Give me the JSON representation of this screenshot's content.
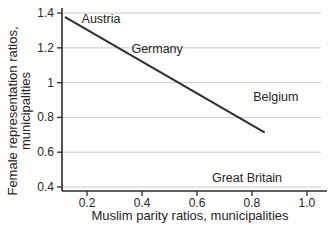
{
  "chart_data": {
    "type": "line",
    "title": "",
    "xlabel": "Muslim parity ratios, municipalities",
    "ylabel": "Female representation ratios, municipalities",
    "ylabel_lines": [
      "Female representation ratios,",
      "municipalities"
    ],
    "xlim": [
      0.109,
      1.073
    ],
    "ylim": [
      0.377,
      1.429
    ],
    "x_ticks": [
      0.2,
      0.4,
      0.6,
      0.8,
      1.0
    ],
    "x_tick_labels": [
      "0.2",
      "0.4",
      "0.6",
      "0.8",
      "1.0"
    ],
    "y_ticks": [
      0.4,
      0.6,
      0.8,
      1.0,
      1.2,
      1.4
    ],
    "y_tick_labels": [
      "0.4",
      "0.6",
      "0.8",
      "1",
      "1.2",
      "1.4"
    ],
    "grid": "horizontal",
    "legend": "none",
    "series": [
      {
        "name": "trend-line",
        "style": "straight-line",
        "points": [
          {
            "x": 0.122,
            "y": 1.375
          },
          {
            "x": 0.844,
            "y": 0.716
          }
        ]
      }
    ],
    "annotations": [
      {
        "label": "Austria",
        "x": 0.251,
        "y": 1.366
      },
      {
        "label": "Germany",
        "x": 0.455,
        "y": 1.198
      },
      {
        "label": "Belgium",
        "x": 0.887,
        "y": 0.922
      },
      {
        "label": "Great Britain",
        "x": 0.782,
        "y": 0.452
      }
    ],
    "colors": {
      "background": "#fdfdfc",
      "trend_line": "#2e2e2e",
      "axis": "#2b2b2b",
      "grid": "#c9c9c9",
      "text": "#262626"
    }
  }
}
